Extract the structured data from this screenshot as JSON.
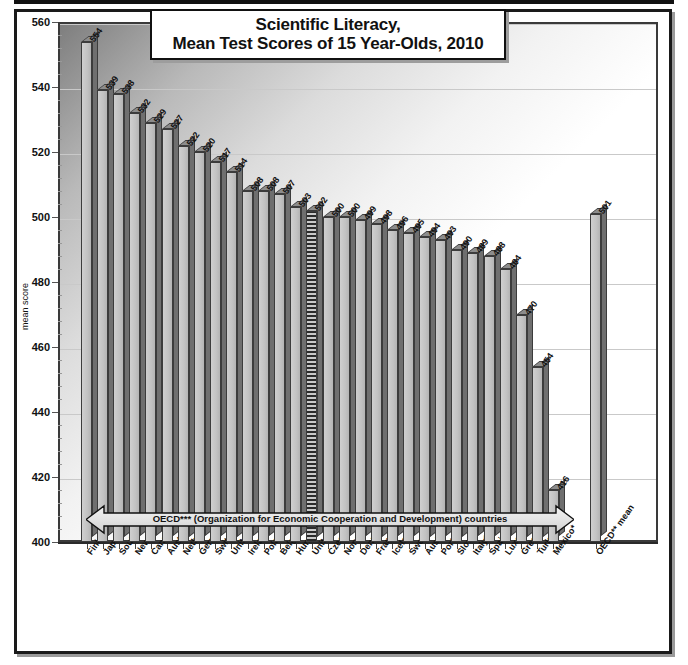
{
  "chart_data": {
    "type": "bar",
    "title": "Scientific Literacy,\nMean Test Scores of 15 Year-Olds, 2010",
    "title_line1": "Scientific Literacy,",
    "title_line2": "Mean Test Scores of 15 Year-Olds, 2010",
    "xlabel": "",
    "ylabel": "mean score",
    "ylim": [
      400,
      560
    ],
    "yticks": [
      400,
      420,
      440,
      460,
      480,
      500,
      520,
      540,
      560
    ],
    "grid": true,
    "legend": "none",
    "annotation": "OECD*** (Organization for Economic Cooperation and Development) countries",
    "highlight_category": "United States*",
    "categories": [
      "Finland",
      "Japan*",
      "South Korea*",
      "New Zeland",
      "Canada*",
      "Australia*",
      "Netherlands",
      "Germany*",
      "Switzerland",
      "United Kingdom*",
      "Ireland",
      "Poland",
      "Belgium",
      "Hungary",
      "United States*",
      "Czech Republic",
      "Norway",
      "Denmark",
      "France*",
      "Iceland",
      "Sweden",
      "Austria",
      "Portugal",
      "Slovakia",
      "Italy*",
      "Spain",
      "Luxembourg",
      "Greece",
      "Turkey*",
      "Mexico*",
      "OECD** mean"
    ],
    "values": [
      554,
      539,
      538,
      532,
      529,
      527,
      522,
      520,
      517,
      514,
      508,
      508,
      507,
      503,
      502,
      500,
      500,
      499,
      498,
      496,
      495,
      494,
      493,
      490,
      489,
      488,
      484,
      470,
      454,
      416,
      501
    ]
  },
  "axis": {
    "y_label": "mean score"
  }
}
